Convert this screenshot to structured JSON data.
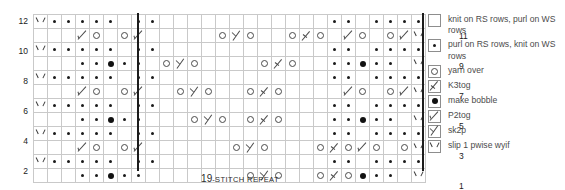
{
  "chart": {
    "caption_number": "19",
    "caption_text": "-STITCH REPEAT",
    "rows": 12,
    "columns": 28,
    "repeat_line_columns": [
      7,
      26
    ],
    "row_numbers_left": [
      "12",
      "",
      "10",
      "",
      "8",
      "",
      "6",
      "",
      "4",
      "",
      "2",
      ""
    ],
    "row_numbers_right": [
      "",
      "11",
      "",
      "9",
      "",
      "7",
      "",
      "5",
      "",
      "3",
      "",
      "1"
    ],
    "symbol_key": {
      "k": "knit",
      "p": "purl",
      "o": "yarn over",
      "t": "K3tog",
      "b": "make bobble",
      "d": "P2tog",
      "s": "sk2p",
      "v": "slip 1 pwise wyif"
    },
    "grid": [
      "vppppp.pp..........pp.ppppp.",
      "....do..od.......os.o..ot.o...",
      "vppppp.pp..........pp.ppppp.",
      "...pp.bpp..os.o......ot.o.pp.bpp.",
      "vppppp.pp..........pp.ppppp.",
      "....do..od....os.o....ot.o....",
      "vppppp.pp..........pp.ppppp.",
      "...pp.bpp.......os.o.ot.o.pp.bpp.",
      "vppppp.pp..........pp.ppppp.",
      "....do..od........os.o....ot.o",
      "vppppp.pp..........pp.ppppp.",
      "...pp.bpp..........os.o..ot.o"
    ],
    "grid_cells": [
      [
        "v",
        "p",
        "p",
        "p",
        "p",
        "p",
        "k",
        "p",
        "p",
        "k",
        "k",
        "k",
        "k",
        "k",
        "k",
        "k",
        "k",
        "k",
        "k",
        "k",
        "k",
        "p",
        "p",
        "k",
        "p",
        "p",
        "p",
        "p"
      ],
      [
        "k",
        "k",
        "k",
        "d",
        "o",
        "k",
        "o",
        "d",
        "k",
        "k",
        "k",
        "k",
        "k",
        "o",
        "s",
        "o",
        "k",
        "k",
        "o",
        "t",
        "o",
        "k",
        "d",
        "o",
        "k",
        "o",
        "d",
        "v"
      ],
      [
        "v",
        "p",
        "p",
        "p",
        "p",
        "p",
        "k",
        "p",
        "p",
        "k",
        "k",
        "k",
        "k",
        "k",
        "k",
        "k",
        "k",
        "k",
        "k",
        "k",
        "k",
        "p",
        "p",
        "k",
        "p",
        "p",
        "p",
        "p"
      ],
      [
        "k",
        "k",
        "k",
        "p",
        "p",
        "b",
        "p",
        "p",
        "k",
        "o",
        "s",
        "o",
        "k",
        "k",
        "k",
        "k",
        "o",
        "t",
        "o",
        "k",
        "k",
        "p",
        "p",
        "b",
        "p",
        "p",
        "k",
        "v"
      ],
      [
        "v",
        "p",
        "p",
        "p",
        "p",
        "p",
        "k",
        "p",
        "p",
        "k",
        "k",
        "k",
        "k",
        "k",
        "k",
        "k",
        "k",
        "k",
        "k",
        "k",
        "k",
        "p",
        "p",
        "k",
        "p",
        "p",
        "p",
        "p"
      ],
      [
        "k",
        "k",
        "k",
        "d",
        "o",
        "k",
        "o",
        "d",
        "k",
        "k",
        "o",
        "s",
        "o",
        "k",
        "k",
        "o",
        "t",
        "o",
        "k",
        "k",
        "k",
        "k",
        "d",
        "o",
        "k",
        "o",
        "d",
        "v"
      ],
      [
        "v",
        "p",
        "p",
        "p",
        "p",
        "p",
        "k",
        "p",
        "p",
        "k",
        "k",
        "k",
        "k",
        "k",
        "k",
        "k",
        "k",
        "k",
        "k",
        "k",
        "k",
        "p",
        "p",
        "k",
        "p",
        "p",
        "p",
        "p"
      ],
      [
        "k",
        "k",
        "k",
        "p",
        "p",
        "b",
        "p",
        "p",
        "k",
        "k",
        "k",
        "o",
        "s",
        "o",
        "k",
        "o",
        "t",
        "o",
        "k",
        "k",
        "k",
        "p",
        "p",
        "b",
        "p",
        "p",
        "k",
        "v"
      ],
      [
        "v",
        "p",
        "p",
        "p",
        "p",
        "p",
        "k",
        "p",
        "p",
        "k",
        "k",
        "k",
        "k",
        "k",
        "k",
        "k",
        "k",
        "k",
        "k",
        "k",
        "k",
        "p",
        "p",
        "k",
        "p",
        "p",
        "p",
        "p"
      ],
      [
        "k",
        "k",
        "k",
        "d",
        "o",
        "k",
        "o",
        "d",
        "k",
        "k",
        "k",
        "k",
        "k",
        "k",
        "o",
        "s",
        "o",
        "k",
        "k",
        "k",
        "o",
        "t",
        "o",
        "d",
        "o",
        "k",
        "o",
        "v"
      ],
      [
        "v",
        "p",
        "p",
        "p",
        "p",
        "p",
        "k",
        "p",
        "p",
        "k",
        "k",
        "k",
        "k",
        "k",
        "k",
        "k",
        "k",
        "k",
        "k",
        "k",
        "k",
        "p",
        "p",
        "k",
        "p",
        "p",
        "p",
        "p"
      ],
      [
        "k",
        "k",
        "k",
        "p",
        "p",
        "b",
        "p",
        "p",
        "k",
        "k",
        "k",
        "k",
        "k",
        "k",
        "k",
        "o",
        "s",
        "o",
        "k",
        "k",
        "o",
        "t",
        "o",
        "b",
        "p",
        "p",
        "k",
        "v"
      ]
    ]
  },
  "legend": {
    "items": [
      {
        "symbol": "k",
        "label": "knit on RS rows, purl on WS rows"
      },
      {
        "symbol": "p",
        "label": "purl on RS rows, knit on WS rows"
      },
      {
        "symbol": "o",
        "label": "yarn over"
      },
      {
        "symbol": "t",
        "label": "K3tog"
      },
      {
        "symbol": "b",
        "label": "make bobble"
      },
      {
        "symbol": "d",
        "label": "P2tog"
      },
      {
        "symbol": "s",
        "label": "sk2p"
      },
      {
        "symbol": "v",
        "label": "slip 1 pwise wyif"
      }
    ]
  },
  "colors": {
    "grid_line": "#c9c9c9",
    "repeat_line": "#1b1b1b",
    "symbol": "#4a4a4a",
    "text": "#4b4b4b"
  }
}
